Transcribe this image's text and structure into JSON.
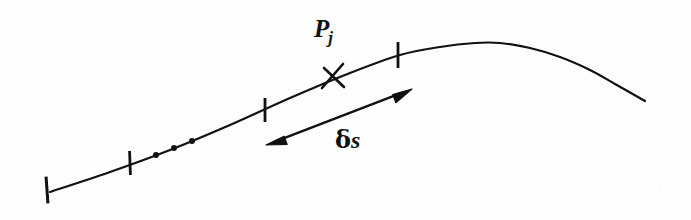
{
  "figure": {
    "kind": "line-diagram",
    "background_color": "#fefefe",
    "ink_color": "#111111",
    "width": 691,
    "height": 220
  },
  "labels": {
    "point_symbol": "P",
    "point_subscript": "j",
    "arc_delta": "δ",
    "arc_variable": "s",
    "ellipsis": "…"
  },
  "chart_data": {
    "type": "line",
    "title": "",
    "xlabel": "",
    "ylabel": "",
    "grid": false,
    "legend": null,
    "xlim": [
      0,
      691
    ],
    "ylim": [
      220,
      0
    ],
    "series": [
      {
        "name": "curve",
        "stroke": "#111111",
        "stroke_width": 2.2,
        "points": [
          [
            50,
            192
          ],
          [
            110,
            172
          ],
          [
            170,
            150
          ],
          [
            230,
            125
          ],
          [
            290,
            98
          ],
          [
            350,
            73
          ],
          [
            400,
            55
          ],
          [
            440,
            47
          ],
          [
            475,
            43
          ],
          [
            500,
            43
          ],
          [
            530,
            48
          ],
          [
            560,
            57
          ],
          [
            590,
            70
          ],
          [
            615,
            84
          ],
          [
            645,
            101
          ]
        ]
      }
    ],
    "tick_marks": [
      {
        "name": "tick-1",
        "x": 47,
        "y": 190,
        "angle_deg": 4,
        "length": 27
      },
      {
        "name": "tick-2",
        "x": 130,
        "y": 163,
        "angle_deg": 2,
        "length": 24
      },
      {
        "name": "tick-3",
        "x": 265,
        "y": 110,
        "angle_deg": 0,
        "length": 24
      },
      {
        "name": "tick-4",
        "x": 398,
        "y": 55,
        "angle_deg": 0,
        "length": 26
      }
    ],
    "point_marker": {
      "name": "point-Pj",
      "glyph": "cross",
      "x": 333,
      "y": 77,
      "size": 22
    },
    "ellipsis_dots": [
      {
        "x": 156,
        "y": 155,
        "r": 3.0
      },
      {
        "x": 174,
        "y": 148,
        "r": 3.0
      },
      {
        "x": 192,
        "y": 141,
        "r": 3.0
      }
    ],
    "arc_arrow": {
      "name": "arc-length-arrow",
      "from": [
        266,
        145
      ],
      "to": [
        412,
        89
      ],
      "double_headed": true,
      "stroke_width": 2.4,
      "label": "δs"
    },
    "annotations": [
      {
        "name": "point-label",
        "text": "P_j",
        "x": 326,
        "y": 30
      },
      {
        "name": "arc-label",
        "text": "δs",
        "x": 354,
        "y": 144
      }
    ]
  }
}
